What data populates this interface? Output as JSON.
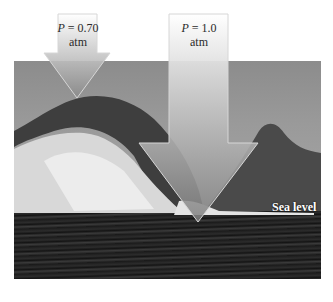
{
  "figure": {
    "arrows": [
      {
        "id": "altitude",
        "p_symbol": "P",
        "equals": " = ",
        "value": "0.70",
        "unit": "atm"
      },
      {
        "id": "sea-level",
        "p_symbol": "P",
        "equals": " = ",
        "value": "1.0",
        "unit": "atm"
      }
    ],
    "labels": {
      "sea_level": "Sea level"
    },
    "colors": {
      "arrow_top": "#f2f2f2",
      "arrow_bottom": "#8e8e8e",
      "arrow_outline": "#d8d8d8",
      "sea": "#1e1e1e",
      "sky": "#9a9a9a"
    }
  }
}
